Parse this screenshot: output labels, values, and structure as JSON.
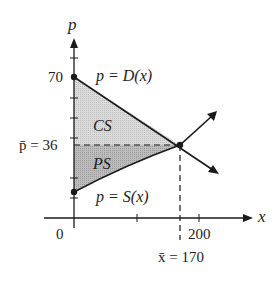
{
  "diagram": {
    "axes": {
      "x_label": "x",
      "y_label": "p",
      "origin_label": "0",
      "x_tick_label": "200",
      "y_tick_label": "70"
    },
    "equilibrium": {
      "p_label": "p̄ = 36",
      "x_label": "x̄ = 170",
      "p_value": 36,
      "x_value": 170
    },
    "curves": {
      "demand_label": "p = D(x)",
      "supply_label": "p = S(x)"
    },
    "regions": {
      "consumer_surplus": "CS",
      "producer_surplus": "PS"
    },
    "colors": {
      "cs_fill": "#d9d9d9",
      "ps_fill": "#b5b5b5",
      "line": "#1a1a1a"
    }
  }
}
